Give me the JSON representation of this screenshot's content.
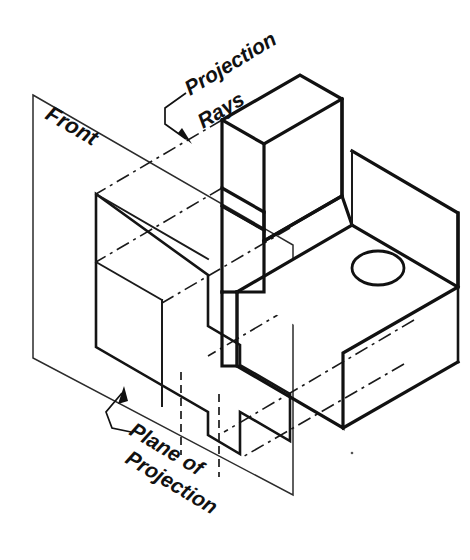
{
  "figure": {
    "type": "isometric-technical-drawing",
    "background_color": "#ffffff",
    "line_color": "#111111"
  },
  "labels": {
    "front": "Front",
    "projection_rays_line1": "Projection",
    "projection_rays_line2": "Rays",
    "plane_of_projection_line1": "Plane of",
    "plane_of_projection_line2": "Projection"
  },
  "annotations": [
    {
      "name": "projection-rays",
      "text": "Projection Rays",
      "rotation_deg": -31,
      "leader": "bracket with arrow pointing down-left to a projection ray"
    },
    {
      "name": "plane-of-projection",
      "text": "Plane of Projection",
      "rotation_deg": 31,
      "leader": "bracket with arrow pointing up-right to the plane edge"
    },
    {
      "name": "front",
      "text": "Front",
      "rotation_deg": 31,
      "leader": "none"
    }
  ],
  "geometry": {
    "plane_of_projection": {
      "corners": [
        [
          33,
          95
        ],
        [
          293,
          245
        ],
        [
          293,
          495
        ],
        [
          33,
          358
        ]
      ],
      "style": "thin outline, no fill"
    },
    "projected_front_view": {
      "description": "L-shaped front view with two hidden lines for the hole",
      "outline": [
        [
          96,
          210
        ],
        [
          208,
          275
        ],
        [
          208,
          432
        ],
        [
          240,
          451
        ],
        [
          240,
          412
        ],
        [
          290,
          441
        ],
        [
          290,
          394
        ],
        [
          240,
          365
        ],
        [
          240,
          326
        ],
        [
          208,
          345
        ],
        [
          208,
          275
        ]
      ],
      "hidden_lines": 2
    },
    "object": {
      "description": "Upper vertical block with notch, base slab with circular hole",
      "hole": {
        "shape": "ellipse",
        "cx": 378,
        "cy": 268,
        "rx": 26,
        "ry": 17
      }
    },
    "projection_rays": {
      "count": 5,
      "style": "dash-dot (chain) lines",
      "direction_deg": 30
    }
  }
}
